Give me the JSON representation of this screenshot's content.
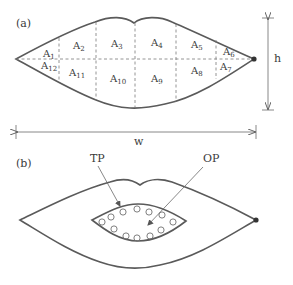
{
  "panel_a": {
    "label": "(a)",
    "regions": [
      {
        "base": "A",
        "sub": "1"
      },
      {
        "base": "A",
        "sub": "2"
      },
      {
        "base": "A",
        "sub": "3"
      },
      {
        "base": "A",
        "sub": "4"
      },
      {
        "base": "A",
        "sub": "5"
      },
      {
        "base": "A",
        "sub": "6"
      },
      {
        "base": "A",
        "sub": "7"
      },
      {
        "base": "A",
        "sub": "8"
      },
      {
        "base": "A",
        "sub": "9"
      },
      {
        "base": "A",
        "sub": "10"
      },
      {
        "base": "A",
        "sub": "11"
      },
      {
        "base": "A",
        "sub": "12"
      }
    ],
    "height_label": "h",
    "width_label": "w"
  },
  "panel_b": {
    "label": "(b)",
    "tp_label": "TP",
    "op_label": "OP",
    "pin_count": 12
  }
}
